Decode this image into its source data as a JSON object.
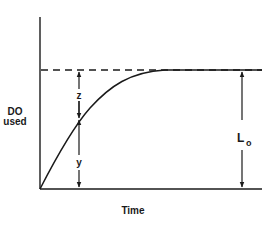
{
  "diagram": {
    "type": "bod-curve",
    "y_axis_label_line1": "DO",
    "y_axis_label_line2": "used",
    "x_axis_label": "Time",
    "segment_upper_label": "z",
    "segment_lower_label": "y",
    "ultimate_label_main": "L",
    "ultimate_label_sub": "o",
    "asymptote_style": "dashed",
    "line_color": "#1a1a1a"
  }
}
